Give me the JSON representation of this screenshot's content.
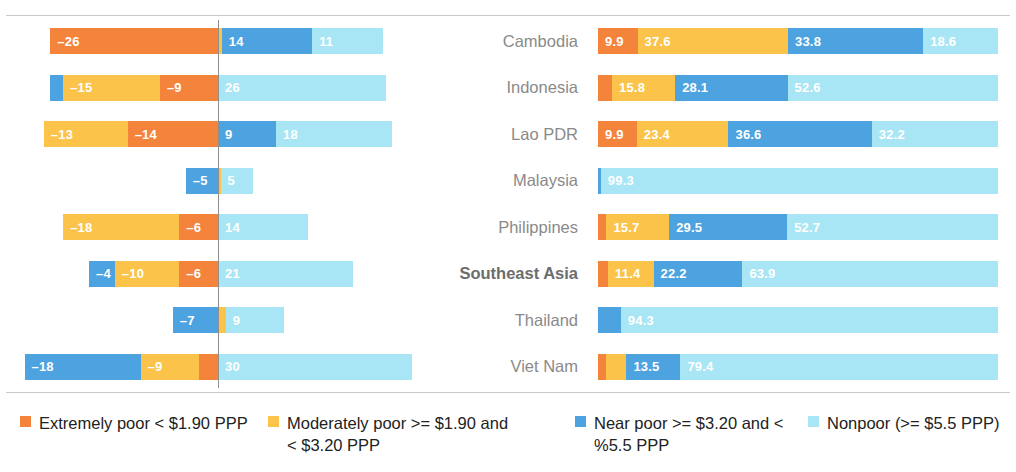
{
  "chart_data": {
    "type": "bar",
    "title": "",
    "subtitle": "",
    "xlabel": "",
    "ylabel": "",
    "grid": false,
    "legend_position": "bottom",
    "categories": [
      "Cambodia",
      "Indonesia",
      "Lao PDR",
      "Malaysia",
      "Philippines",
      "Southeast Asia",
      "Thailand",
      "Viet Nam"
    ],
    "series": [
      {
        "name": "Extremely poor < $1.90 PPP",
        "color": "#F4833C"
      },
      {
        "name": "Moderately poor >= $1.90 and < $3.20 PPP",
        "color": "#FBC34A"
      },
      {
        "name": "Near poor >= $3.20 and < %5.5 PPP",
        "color": "#4DA3E0"
      },
      {
        "name": "Nonpoor (>= $5.5 PPP)",
        "color": "#A8E6F5"
      }
    ],
    "panels": [
      {
        "name": "change",
        "axis": "diverging",
        "note": "negative segments extend left of zero line, positive extend right",
        "rows": [
          {
            "category": "Cambodia",
            "negative": [
              {
                "series": "Extremely poor < $1.90 PPP",
                "value": -26,
                "label": "–26",
                "color": "#F4833C"
              }
            ],
            "positive": [
              {
                "series": "Moderately poor >= $1.90 and < $3.20 PPP",
                "value": 0.6,
                "label": "",
                "color": "#FBC34A"
              },
              {
                "series": "Near poor >= $3.20 and < %5.5 PPP",
                "value": 14,
                "label": "14",
                "color": "#4DA3E0"
              },
              {
                "series": "Nonpoor (>= $5.5 PPP)",
                "value": 11,
                "label": "11",
                "color": "#A8E6F5"
              }
            ]
          },
          {
            "category": "Indonesia",
            "negative": [
              {
                "series": "Near poor >= $3.20 and < %5.5 PPP",
                "value": -2,
                "label": "",
                "color": "#4DA3E0"
              },
              {
                "series": "Moderately poor >= $1.90 and < $3.20 PPP",
                "value": -15,
                "label": "–15",
                "color": "#FBC34A"
              },
              {
                "series": "Extremely poor < $1.90 PPP",
                "value": -9,
                "label": "–9",
                "color": "#F4833C"
              }
            ],
            "positive": [
              {
                "series": "Nonpoor (>= $5.5 PPP)",
                "value": 26,
                "label": "26",
                "color": "#A8E6F5"
              }
            ]
          },
          {
            "category": "Lao PDR",
            "negative": [
              {
                "series": "Moderately poor >= $1.90 and < $3.20 PPP",
                "value": -13,
                "label": "–13",
                "color": "#FBC34A"
              },
              {
                "series": "Extremely poor < $1.90 PPP",
                "value": -14,
                "label": "–14",
                "color": "#F4833C"
              }
            ],
            "positive": [
              {
                "series": "Near poor >= $3.20 and < %5.5 PPP",
                "value": 9,
                "label": "9",
                "color": "#4DA3E0"
              },
              {
                "series": "Nonpoor (>= $5.5 PPP)",
                "value": 18,
                "label": "18",
                "color": "#A8E6F5"
              }
            ]
          },
          {
            "category": "Malaysia",
            "negative": [
              {
                "series": "Near poor >= $3.20 and < %5.5 PPP",
                "value": -5,
                "label": "–5",
                "color": "#4DA3E0"
              }
            ],
            "positive": [
              {
                "series": "Moderately poor >= $1.90 and < $3.20 PPP",
                "value": 0.4,
                "label": "",
                "color": "#FBC34A"
              },
              {
                "series": "Nonpoor (>= $5.5 PPP)",
                "value": 5,
                "label": "5",
                "color": "#A8E6F5"
              }
            ]
          },
          {
            "category": "Philippines",
            "negative": [
              {
                "series": "Moderately poor >= $1.90 and < $3.20 PPP",
                "value": -18,
                "label": "–18",
                "color": "#FBC34A"
              },
              {
                "series": "Extremely poor < $1.90 PPP",
                "value": -6,
                "label": "–6",
                "color": "#F4833C"
              }
            ],
            "positive": [
              {
                "series": "Nonpoor (>= $5.5 PPP)",
                "value": 14,
                "label": "14",
                "color": "#A8E6F5"
              }
            ]
          },
          {
            "category": "Southeast Asia",
            "negative": [
              {
                "series": "Near poor >= $3.20 and < %5.5 PPP",
                "value": -4,
                "label": "–4",
                "color": "#4DA3E0"
              },
              {
                "series": "Moderately poor >= $1.90 and < $3.20 PPP",
                "value": -10,
                "label": "–10",
                "color": "#FBC34A"
              },
              {
                "series": "Extremely poor < $1.90 PPP",
                "value": -6,
                "label": "–6",
                "color": "#F4833C"
              }
            ],
            "positive": [
              {
                "series": "Nonpoor (>= $5.5 PPP)",
                "value": 21,
                "label": "21",
                "color": "#A8E6F5"
              }
            ]
          },
          {
            "category": "Thailand",
            "negative": [
              {
                "series": "Near poor >= $3.20 and < %5.5 PPP",
                "value": -7,
                "label": "–7",
                "color": "#4DA3E0"
              }
            ],
            "positive": [
              {
                "series": "Moderately poor >= $1.90 and < $3.20 PPP",
                "value": 1.2,
                "label": "",
                "color": "#FBC34A"
              },
              {
                "series": "Nonpoor (>= $5.5 PPP)",
                "value": 9,
                "label": "9",
                "color": "#A8E6F5"
              }
            ]
          },
          {
            "category": "Viet Nam",
            "negative": [
              {
                "series": "Near poor >= $3.20 and < %5.5 PPP",
                "value": -18,
                "label": "–18",
                "color": "#4DA3E0"
              },
              {
                "series": "Moderately poor >= $1.90 and < $3.20 PPP",
                "value": -9,
                "label": "–9",
                "color": "#FBC34A"
              },
              {
                "series": "Extremely poor < $1.90 PPP",
                "value": -3,
                "label": "",
                "color": "#F4833C"
              }
            ],
            "positive": [
              {
                "series": "Nonpoor (>= $5.5 PPP)",
                "value": 30,
                "label": "30",
                "color": "#A8E6F5"
              }
            ]
          }
        ]
      },
      {
        "name": "distribution",
        "axis": "stacked-100",
        "rows": [
          {
            "category": "Cambodia",
            "segments": [
              {
                "series": "Extremely poor < $1.90 PPP",
                "value": 9.9,
                "label": "9.9",
                "color": "#F4833C"
              },
              {
                "series": "Moderately poor >= $1.90 and < $3.20 PPP",
                "value": 37.6,
                "label": "37.6",
                "color": "#FBC34A"
              },
              {
                "series": "Near poor >= $3.20 and < %5.5 PPP",
                "value": 33.8,
                "label": "33.8",
                "color": "#4DA3E0"
              },
              {
                "series": "Nonpoor (>= $5.5 PPP)",
                "value": 18.6,
                "label": "18.6",
                "color": "#A8E6F5"
              }
            ]
          },
          {
            "category": "Indonesia",
            "segments": [
              {
                "series": "Extremely poor < $1.90 PPP",
                "value": 3.5,
                "label": "",
                "color": "#F4833C"
              },
              {
                "series": "Moderately poor >= $1.90 and < $3.20 PPP",
                "value": 15.8,
                "label": "15.8",
                "color": "#FBC34A"
              },
              {
                "series": "Near poor >= $3.20 and < %5.5 PPP",
                "value": 28.1,
                "label": "28.1",
                "color": "#4DA3E0"
              },
              {
                "series": "Nonpoor (>= $5.5 PPP)",
                "value": 52.6,
                "label": "52.6",
                "color": "#A8E6F5"
              }
            ]
          },
          {
            "category": "Lao PDR",
            "segments": [
              {
                "series": "Extremely poor < $1.90 PPP",
                "value": 9.9,
                "label": "9.9",
                "color": "#F4833C"
              },
              {
                "series": "Moderately poor >= $1.90 and < $3.20 PPP",
                "value": 23.4,
                "label": "23.4",
                "color": "#FBC34A"
              },
              {
                "series": "Near poor >= $3.20 and < %5.5 PPP",
                "value": 36.6,
                "label": "36.6",
                "color": "#4DA3E0"
              },
              {
                "series": "Nonpoor (>= $5.5 PPP)",
                "value": 32.2,
                "label": "32.2",
                "color": "#A8E6F5"
              }
            ]
          },
          {
            "category": "Malaysia",
            "segments": [
              {
                "series": "Near poor >= $3.20 and < %5.5 PPP",
                "value": 0.7,
                "label": "",
                "color": "#4DA3E0"
              },
              {
                "series": "Nonpoor (>= $5.5 PPP)",
                "value": 99.3,
                "label": "99.3",
                "color": "#A8E6F5"
              }
            ]
          },
          {
            "category": "Philippines",
            "segments": [
              {
                "series": "Extremely poor < $1.90 PPP",
                "value": 2.1,
                "label": "",
                "color": "#F4833C"
              },
              {
                "series": "Moderately poor >= $1.90 and < $3.20 PPP",
                "value": 15.7,
                "label": "15.7",
                "color": "#FBC34A"
              },
              {
                "series": "Near poor >= $3.20 and < %5.5 PPP",
                "value": 29.5,
                "label": "29.5",
                "color": "#4DA3E0"
              },
              {
                "series": "Nonpoor (>= $5.5 PPP)",
                "value": 52.7,
                "label": "52.7",
                "color": "#A8E6F5"
              }
            ]
          },
          {
            "category": "Southeast Asia",
            "segments": [
              {
                "series": "Extremely poor < $1.90 PPP",
                "value": 2.5,
                "label": "",
                "color": "#F4833C"
              },
              {
                "series": "Moderately poor >= $1.90 and < $3.20 PPP",
                "value": 11.4,
                "label": "11.4",
                "color": "#FBC34A"
              },
              {
                "series": "Near poor >= $3.20 and < %5.5 PPP",
                "value": 22.2,
                "label": "22.2",
                "color": "#4DA3E0"
              },
              {
                "series": "Nonpoor (>= $5.5 PPP)",
                "value": 63.9,
                "label": "63.9",
                "color": "#A8E6F5"
              }
            ]
          },
          {
            "category": "Thailand",
            "segments": [
              {
                "series": "Near poor >= $3.20 and < %5.5 PPP",
                "value": 5.7,
                "label": "",
                "color": "#4DA3E0"
              },
              {
                "series": "Nonpoor (>= $5.5 PPP)",
                "value": 94.3,
                "label": "94.3",
                "color": "#A8E6F5"
              }
            ]
          },
          {
            "category": "Viet Nam",
            "segments": [
              {
                "series": "Extremely poor < $1.90 PPP",
                "value": 1.9,
                "label": "",
                "color": "#F4833C"
              },
              {
                "series": "Moderately poor >= $1.90 and < $3.20 PPP",
                "value": 5.2,
                "label": "",
                "color": "#FBC34A"
              },
              {
                "series": "Near poor >= $3.20 and < %5.5 PPP",
                "value": 13.5,
                "label": "13.5",
                "color": "#4DA3E0"
              },
              {
                "series": "Nonpoor (>= $5.5 PPP)",
                "value": 79.4,
                "label": "79.4",
                "color": "#A8E6F5"
              }
            ]
          }
        ]
      }
    ]
  },
  "labels": {
    "rows": [
      {
        "text": "Cambodia",
        "bold": false
      },
      {
        "text": "Indonesia",
        "bold": false
      },
      {
        "text": "Lao PDR",
        "bold": false
      },
      {
        "text": "Malaysia",
        "bold": false
      },
      {
        "text": "Philippines",
        "bold": false
      },
      {
        "text": "Southeast Asia",
        "bold": true
      },
      {
        "text": "Thailand",
        "bold": false
      },
      {
        "text": "Viet Nam",
        "bold": false
      }
    ]
  },
  "legend": {
    "items": [
      {
        "label": "Extremely poor < $1.90 PPP",
        "color": "#F4833C"
      },
      {
        "label": "Moderately poor >= $1.90 and < $3.20 PPP",
        "color": "#FBC34A"
      },
      {
        "label": "Near poor >= $3.20 and < %5.5 PPP",
        "color": "#4DA3E0"
      },
      {
        "label": "Nonpoor (>= $5.5 PPP)",
        "color": "#A8E6F5"
      }
    ]
  }
}
